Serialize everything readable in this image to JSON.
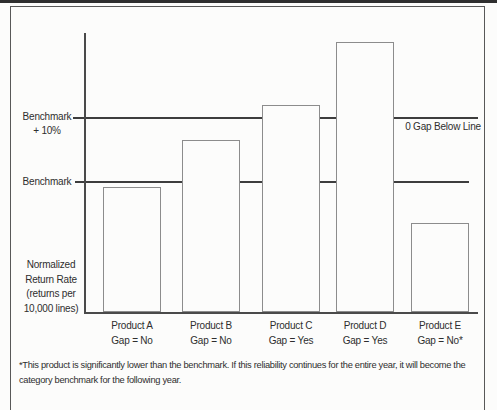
{
  "figure": {
    "background": "#fcfcfb",
    "box_border_color": "#585858",
    "axis_color": "#4a4a4a",
    "reference_line_color": "#3d3d3d",
    "bar_border_color": "#8c8c8c",
    "text_color": "#2e2e2e"
  },
  "chart_data": {
    "type": "bar",
    "title": "",
    "ylabel": "Normalized\nReturn Rate\n(returns per\n10,000 lines)",
    "xlabel": "",
    "categories": [
      "Product A",
      "Product B",
      "Product C",
      "Product D",
      "Product E"
    ],
    "gap_labels": [
      "Gap = No",
      "Gap = No",
      "Gap = Yes",
      "Gap = Yes",
      "Gap = No*"
    ],
    "values": [
      125,
      172,
      207,
      270,
      89
    ],
    "value_scale": "relative height, schematic axis (no numeric ticks shown)",
    "ylim": [
      0,
      280
    ],
    "grid": false,
    "legend": null,
    "reference_lines": [
      {
        "label": "Benchmark\n+ 10%",
        "value": 195
      },
      {
        "label": "Benchmark",
        "value": 131
      }
    ],
    "annotation_right": "0 Gap Below Line",
    "footnote": "*This product is significantly lower than the benchmark. If this reliability continues for the entire year, it will become the\ncategory benchmark for the following year."
  }
}
